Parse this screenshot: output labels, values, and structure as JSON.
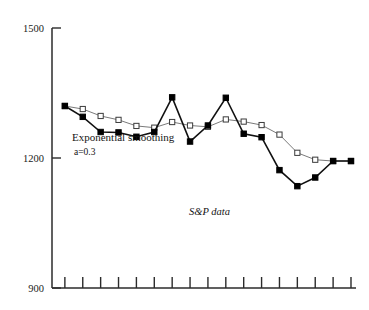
{
  "chart_data": {
    "type": "line",
    "title": "",
    "subtitle": "",
    "xlabel": "",
    "ylabel": "",
    "ylim": [
      900,
      1500
    ],
    "yticks": [
      900,
      1200,
      1500
    ],
    "ytick_labels": [
      "900",
      "1200",
      "1500"
    ],
    "grid": false,
    "legend_position": "inline-annotations",
    "x_tick_count": 17,
    "x_tick_labels": [],
    "x": [
      1,
      2,
      3,
      4,
      5,
      6,
      7,
      8,
      9,
      10,
      11,
      12,
      13,
      14,
      15,
      16,
      17
    ],
    "series": [
      {
        "name": "S&P data",
        "marker": "filled-square",
        "color": "#000000",
        "values": [
          1320,
          1295,
          1260,
          1259,
          1249,
          1260,
          1340,
          1238,
          1275,
          1339,
          1256,
          1248,
          1172,
          1135,
          1155,
          1193,
          1193
        ]
      },
      {
        "name": "Exponential smoothing a=0.3",
        "marker": "open-square",
        "color": "#7a7a7a",
        "values": [
          1320,
          1313,
          1297,
          1288,
          1274,
          1270,
          1283,
          1275,
          1272,
          1289,
          1284,
          1276,
          1254,
          1212,
          1196,
          1193,
          1193
        ]
      }
    ],
    "annotations": [
      {
        "text": "Exponential smoothing",
        "name": "annotation-exponential-smoothing"
      },
      {
        "text": "a=0.3",
        "name": "annotation-alpha"
      },
      {
        "text": "S&P data",
        "name": "annotation-sp-data"
      }
    ]
  },
  "colors": {
    "axis": "#2b2b2b",
    "raw_series": "#000000",
    "smooth_series": "#7a7a7a",
    "background": "#ffffff"
  }
}
